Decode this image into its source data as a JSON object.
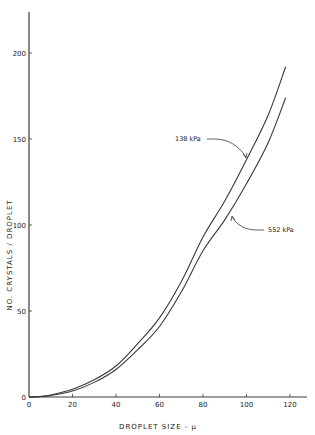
{
  "chart_data": {
    "type": "line",
    "title": "",
    "xlabel": "DROPLET SIZE - μ",
    "ylabel": "NO. CRYSTALS / DROPLET",
    "xlim": [
      0,
      125
    ],
    "ylim": [
      0,
      225
    ],
    "xticks": [
      0,
      20,
      40,
      60,
      80,
      100,
      120
    ],
    "yticks": [
      0,
      50,
      100,
      150,
      200
    ],
    "grid": false,
    "legend": "none (inline annotations with leader arrows)",
    "x": [
      0,
      5,
      10,
      20,
      30,
      40,
      50,
      60,
      70,
      80,
      90,
      100,
      110,
      118
    ],
    "series": [
      {
        "name": "138 kPa",
        "values": [
          0,
          0.3,
          1.2,
          4.5,
          10,
          18,
          31,
          46,
          67,
          93,
          114,
          138,
          164,
          192
        ]
      },
      {
        "name": "552 kPa",
        "values": [
          0,
          0.2,
          0.9,
          3.5,
          8.5,
          16,
          27.5,
          41,
          61,
          85,
          103,
          124,
          148,
          174
        ]
      }
    ],
    "annotations": [
      {
        "text": "138 kPa",
        "target_series": "138 kPa",
        "points_at_x": 100
      },
      {
        "text": "552 kPa",
        "target_series": "552 kPa",
        "points_at_x": 103
      }
    ]
  },
  "colors": {
    "background": "#ffffff",
    "line": "#3a3a3a",
    "text": "#222222"
  }
}
